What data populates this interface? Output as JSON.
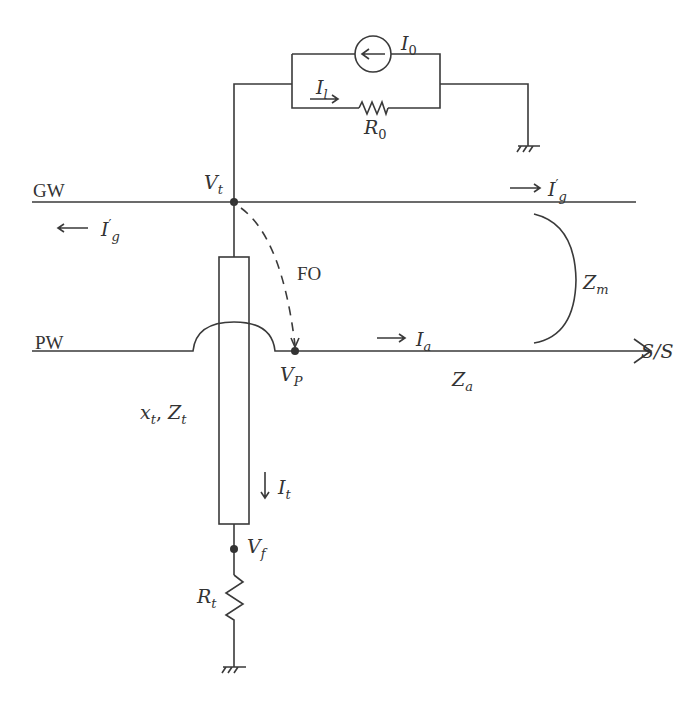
{
  "diagram": {
    "type": "circuit",
    "lines": {
      "ground_wire": "GW",
      "phase_wire": "PW",
      "substation": "S/S",
      "flashover": "FO"
    },
    "labels": {
      "I0": "I",
      "I0_sub": "0",
      "Il": "I",
      "Il_sub": "l",
      "R0": "R",
      "R0_sub": "0",
      "Vt": "V",
      "Vt_sub": "t",
      "Ig_right": "I",
      "Ig_right_sup": "′",
      "Ig_right_sub": "g",
      "Ig_left": "I",
      "Ig_left_sup": "′",
      "Ig_left_sub": "g",
      "Zm": "Z",
      "Zm_sub": "m",
      "Ia": "I",
      "Ia_sub": "a",
      "Za": "Z",
      "Za_sub": "a",
      "Vp": "V",
      "Vp_sub": "P",
      "xt": "x",
      "xt_sub": "t",
      "Zt": "Z",
      "Zt_sub": "t",
      "It": "I",
      "It_sub": "t",
      "Vf": "V",
      "Vf_sub": "f",
      "Rt": "R",
      "Rt_sub": "t",
      "comma": ","
    },
    "arrows": {
      "right": "→",
      "left": "←",
      "down": "↓"
    }
  }
}
